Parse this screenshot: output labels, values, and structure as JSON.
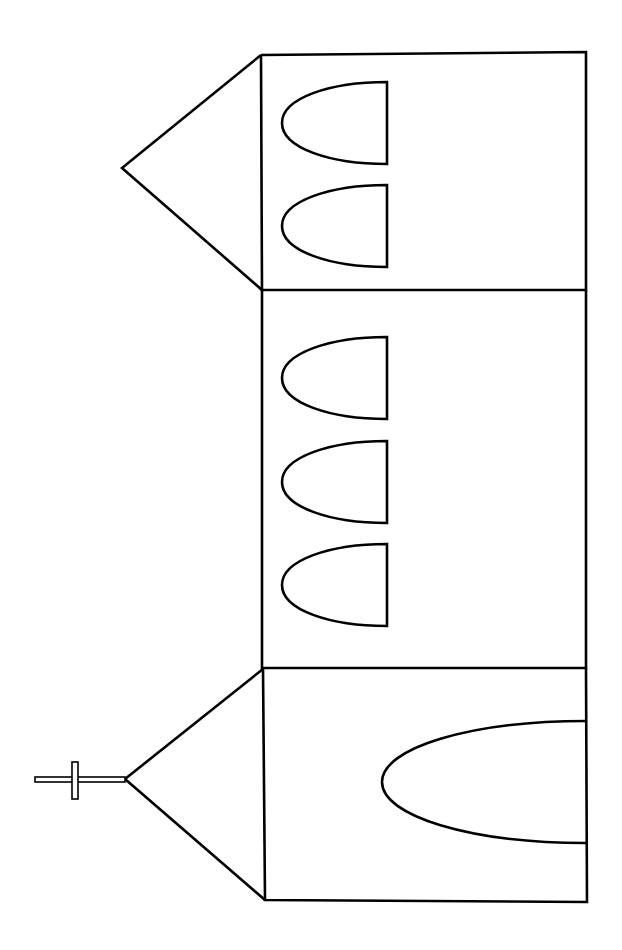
{
  "drawing": {
    "subject": "church line drawing (rotated 90°)",
    "background_color": "#ffffff",
    "stroke_color": "#000000",
    "parts": {
      "tower_roof": "triangular spire roof",
      "tower": "tower section with two arched windows",
      "nave": "nave section with three arched windows",
      "front_gable": "front gable roof with cross",
      "front": "front section with arched door",
      "cross": "cross on gable peak"
    },
    "counts": {
      "tower_windows": 2,
      "nave_windows": 3,
      "doors": 1
    }
  }
}
